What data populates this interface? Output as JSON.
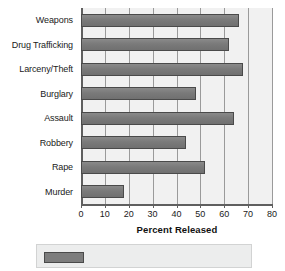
{
  "chart_data": {
    "type": "bar",
    "orientation": "horizontal",
    "title": "",
    "xlabel": "Percent Released",
    "ylabel": "",
    "xlim": [
      0,
      80
    ],
    "xticks": [
      0,
      10,
      20,
      30,
      40,
      50,
      60,
      70,
      80
    ],
    "xtick_labels": [
      "0",
      "10",
      "20",
      "30",
      "40",
      "50",
      "60",
      "70",
      "80"
    ],
    "grid": true,
    "grid_axis": "x",
    "legend": "none",
    "categories": [
      "Weapons",
      "Drug Trafficking",
      "Larceny/Theft",
      "Burglary",
      "Assault",
      "Robbery",
      "Rape",
      "Murder"
    ],
    "values": [
      66,
      62,
      68,
      48,
      64,
      44,
      52,
      18
    ],
    "series": [
      {
        "name": "Percent Released",
        "values": [
          66,
          62,
          68,
          48,
          64,
          44,
          52,
          18
        ]
      }
    ],
    "bar_color": "#7d7d7d",
    "bar_edge_color": "#4a4a4a",
    "plot_background": "#f1f1f1",
    "axis_color": "#5f5f5f",
    "gridline_color": "#9a9a9a"
  }
}
